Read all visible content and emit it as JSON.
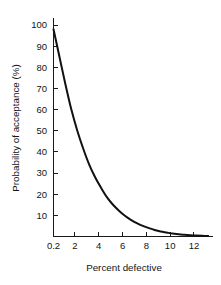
{
  "chart_data": {
    "type": "line",
    "title": "",
    "subtitle": "",
    "xlabel": "Percent defective",
    "ylabel": "Probability of acceptance (%)",
    "xlim": [
      0.2,
      13.6
    ],
    "ylim": [
      0,
      100
    ],
    "grid": false,
    "legend": null,
    "xticks": [
      0.2,
      2,
      4,
      6,
      8,
      10,
      12
    ],
    "xticklabels": [
      "0.2",
      "2",
      "4",
      "6",
      "8",
      "10",
      "12"
    ],
    "yticks": [
      10,
      20,
      30,
      40,
      50,
      60,
      70,
      80,
      90,
      100
    ],
    "yticklabels": [
      "10",
      "20",
      "30",
      "40",
      "50",
      "60",
      "70",
      "80",
      "90",
      "100"
    ],
    "series": [
      {
        "name": "Operating characteristic curve",
        "color": "#111111",
        "x": [
          0.2,
          0.7,
          1.2,
          1.7,
          2.2,
          2.7,
          3.2,
          3.7,
          4.2,
          4.7,
          5.2,
          5.7,
          6.2,
          6.7,
          7.2,
          7.7,
          8.2,
          8.7,
          9.2,
          9.7,
          10.2,
          10.7,
          11.2,
          11.7,
          12.2,
          12.7,
          13.2
        ],
        "y": [
          98,
          85,
          72,
          60,
          50,
          41.5,
          34,
          28,
          23,
          18.5,
          15,
          12.2,
          9.8,
          7.9,
          6.3,
          5.0,
          4.0,
          3.1,
          2.4,
          1.9,
          1.4,
          1.1,
          0.8,
          0.6,
          0.45,
          0.3,
          0.2
        ]
      }
    ],
    "annotations": []
  },
  "axis_titles": {
    "x": "Percent defective",
    "y": "Probability of acceptance (%)"
  }
}
